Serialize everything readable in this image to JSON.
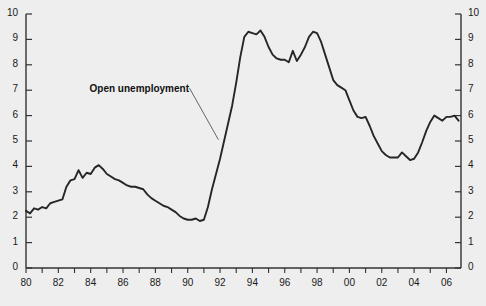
{
  "chart_data": {
    "type": "line",
    "title": "",
    "subtitle": "",
    "xlabel": "",
    "ylabel": "",
    "xlim": [
      1980,
      2006.9
    ],
    "ylim": [
      0,
      10
    ],
    "grid": false,
    "legend_position": "none",
    "annotations": [
      {
        "text": "Open unemployment",
        "x": 1989.0,
        "y": 7.0,
        "leader_to_x": 1991.9,
        "leader_to_y": 5.05
      }
    ],
    "y_ticks": [
      0,
      1,
      2,
      3,
      4,
      5,
      6,
      7,
      8,
      9,
      10
    ],
    "y_tick_labels": [
      "0",
      "1",
      "2",
      "3",
      "4",
      "5",
      "6",
      "7",
      "8",
      "9",
      "10"
    ],
    "y_axis_duplicated_right": true,
    "x_ticks": [
      1980,
      1981,
      1982,
      1983,
      1984,
      1985,
      1986,
      1987,
      1988,
      1989,
      1990,
      1991,
      1992,
      1993,
      1994,
      1995,
      1996,
      1997,
      1998,
      1999,
      2000,
      2001,
      2002,
      2003,
      2004,
      2005,
      2006
    ],
    "x_tick_labels": [
      "80",
      "",
      "82",
      "",
      "84",
      "",
      "86",
      "",
      "88",
      "",
      "90",
      "",
      "92",
      "",
      "94",
      "",
      "96",
      "",
      "98",
      "",
      "00",
      "",
      "02",
      "",
      "04",
      "",
      "06"
    ],
    "series": [
      {
        "name": "Open unemployment",
        "color": "#262626",
        "x": [
          1980.0,
          1980.25,
          1980.5,
          1980.75,
          1981.0,
          1981.25,
          1981.5,
          1981.75,
          1982.0,
          1982.25,
          1982.5,
          1982.75,
          1983.0,
          1983.25,
          1983.5,
          1983.75,
          1984.0,
          1984.25,
          1984.5,
          1984.75,
          1985.0,
          1985.25,
          1985.5,
          1985.75,
          1986.0,
          1986.25,
          1986.5,
          1986.75,
          1987.0,
          1987.25,
          1987.5,
          1987.75,
          1988.0,
          1988.25,
          1988.5,
          1988.75,
          1989.0,
          1989.25,
          1989.5,
          1989.75,
          1990.0,
          1990.25,
          1990.5,
          1990.75,
          1991.0,
          1991.25,
          1991.5,
          1991.75,
          1992.0,
          1992.25,
          1992.5,
          1992.75,
          1993.0,
          1993.25,
          1993.5,
          1993.75,
          1994.0,
          1994.25,
          1994.5,
          1994.75,
          1995.0,
          1995.25,
          1995.5,
          1995.75,
          1996.0,
          1996.25,
          1996.5,
          1996.75,
          1997.0,
          1997.25,
          1997.5,
          1997.75,
          1998.0,
          1998.25,
          1998.5,
          1998.75,
          1999.0,
          1999.25,
          1999.5,
          1999.75,
          2000.0,
          2000.25,
          2000.5,
          2000.75,
          2001.0,
          2001.25,
          2001.5,
          2001.75,
          2002.0,
          2002.25,
          2002.5,
          2002.75,
          2003.0,
          2003.25,
          2003.5,
          2003.75,
          2004.0,
          2004.25,
          2004.5,
          2004.75,
          2005.0,
          2005.25,
          2005.5,
          2005.75,
          2006.0,
          2006.25,
          2006.5,
          2006.75
        ],
        "y": [
          2.25,
          2.15,
          2.35,
          2.3,
          2.4,
          2.35,
          2.55,
          2.6,
          2.65,
          2.7,
          3.2,
          3.45,
          3.5,
          3.85,
          3.55,
          3.75,
          3.7,
          3.95,
          4.05,
          3.9,
          3.7,
          3.6,
          3.5,
          3.45,
          3.35,
          3.25,
          3.2,
          3.2,
          3.15,
          3.1,
          2.9,
          2.75,
          2.65,
          2.55,
          2.45,
          2.4,
          2.3,
          2.2,
          2.05,
          1.95,
          1.9,
          1.9,
          1.95,
          1.85,
          1.9,
          2.4,
          3.1,
          3.7,
          4.3,
          5.0,
          5.7,
          6.4,
          7.3,
          8.3,
          9.1,
          9.3,
          9.25,
          9.2,
          9.35,
          9.1,
          8.7,
          8.4,
          8.25,
          8.2,
          8.2,
          8.1,
          8.55,
          8.15,
          8.4,
          8.7,
          9.1,
          9.3,
          9.25,
          8.9,
          8.4,
          7.9,
          7.4,
          7.2,
          7.1,
          7.0,
          6.6,
          6.2,
          5.95,
          5.9,
          5.95,
          5.6,
          5.2,
          4.9,
          4.6,
          4.45,
          4.35,
          4.35,
          4.35,
          4.55,
          4.4,
          4.25,
          4.3,
          4.55,
          4.95,
          5.4,
          5.75,
          6.0,
          5.9,
          5.8,
          5.95,
          5.95,
          6.0,
          5.8
        ]
      }
    ]
  }
}
